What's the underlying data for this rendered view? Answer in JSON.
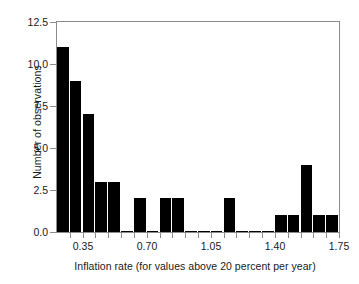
{
  "chart_data": {
    "type": "bar",
    "title": "",
    "subtitle": "",
    "xlabel": "Inflation rate (for values above 20 percent per year)",
    "ylabel": "Number of observations",
    "xlim": [
      0.21,
      1.75
    ],
    "ylim": [
      0.0,
      12.5
    ],
    "grid": false,
    "legend": null,
    "bin_width": 0.07,
    "bin_edges": [
      0.21,
      0.28,
      0.35,
      0.42,
      0.49,
      0.56,
      0.63,
      0.7,
      0.77,
      0.84,
      0.91,
      0.98,
      1.05,
      1.12,
      1.19,
      1.26,
      1.33,
      1.4,
      1.47,
      1.54,
      1.61,
      1.68,
      1.75
    ],
    "categories": [
      "0.21-0.28",
      "0.28-0.35",
      "0.35-0.42",
      "0.42-0.49",
      "0.49-0.56",
      "0.56-0.63",
      "0.63-0.70",
      "0.70-0.77",
      "0.77-0.84",
      "0.84-0.91",
      "0.91-0.98",
      "0.98-1.05",
      "1.05-1.12",
      "1.12-1.19",
      "1.19-1.26",
      "1.26-1.33",
      "1.33-1.40",
      "1.40-1.47",
      "1.47-1.54",
      "1.54-1.61",
      "1.61-1.68",
      "1.68-1.75"
    ],
    "values": [
      11,
      9,
      7,
      3,
      3,
      0,
      2,
      0,
      2,
      2,
      0,
      0,
      0,
      2,
      0,
      0,
      0,
      1,
      1,
      4,
      1,
      1
    ],
    "bar_color": "#000000",
    "x_ticks_major": [
      0.35,
      0.7,
      1.05,
      1.4,
      1.75
    ],
    "x_tick_labels": [
      "0.35",
      "0.70",
      "1.05",
      "1.40",
      "1.75"
    ],
    "x_ticks_minor": [
      0.28,
      0.42,
      0.49,
      0.56,
      0.63,
      0.77,
      0.84,
      0.91,
      0.98,
      1.12,
      1.19,
      1.26,
      1.33,
      1.47,
      1.54,
      1.61,
      1.68
    ],
    "y_ticks": [
      0.0,
      2.5,
      5.0,
      7.5,
      10.0,
      12.5
    ],
    "y_tick_labels": [
      "0.0",
      "2.5",
      "5.0",
      "7.5",
      "10.0",
      "12.5"
    ],
    "axis_color": "#8c8c8c",
    "text_color": "#1a1a1a",
    "background": "#ffffff"
  }
}
